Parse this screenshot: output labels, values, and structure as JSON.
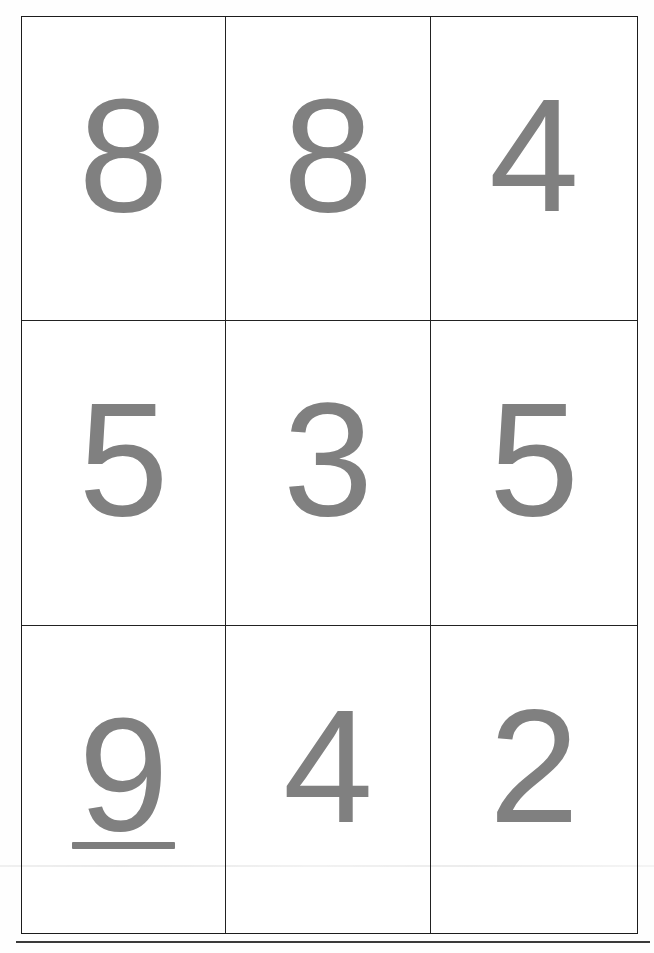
{
  "page": {
    "background_color": "#fefefe",
    "artifact_line_color": "#e8e8e8"
  },
  "grid": {
    "border_color": "#1c1c1c",
    "digit_color": "#808080",
    "rows": 3,
    "columns": 3,
    "cells": [
      {
        "digit": "8",
        "underlined": false
      },
      {
        "digit": "8",
        "underlined": false
      },
      {
        "digit": "4",
        "underlined": false
      },
      {
        "digit": "5",
        "underlined": false
      },
      {
        "digit": "3",
        "underlined": false
      },
      {
        "digit": "5",
        "underlined": false
      },
      {
        "digit": "9",
        "underlined": true
      },
      {
        "digit": "4",
        "underlined": false
      },
      {
        "digit": "2",
        "underlined": false
      }
    ]
  },
  "bottom_rule": {
    "color": "#3a3a3a"
  }
}
